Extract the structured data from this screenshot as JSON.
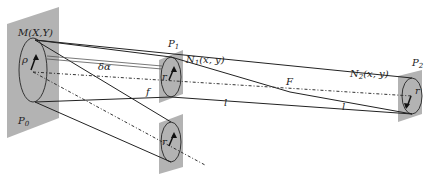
{
  "diagram": {
    "type": "optical-geometry",
    "labels": {
      "M": "M(X,Y)",
      "P0": "P",
      "P0_sub": "0",
      "P1": "P",
      "P1_sub": "1",
      "P2": "P",
      "P2_sub": "2",
      "N1": "N",
      "N1_sub": "1",
      "N1_args": "(x, y)",
      "N2": "N",
      "N2_sub": "2",
      "N2_args": "(x, y)",
      "F": "F",
      "f": "f",
      "l1": "l",
      "l2": "l",
      "delta_alpha": "δα",
      "rho": "ρ",
      "r1": "r",
      "r2": "r",
      "r3": "r"
    },
    "colors": {
      "plane_fill": "#b3b3b3",
      "line": "#222222"
    }
  }
}
